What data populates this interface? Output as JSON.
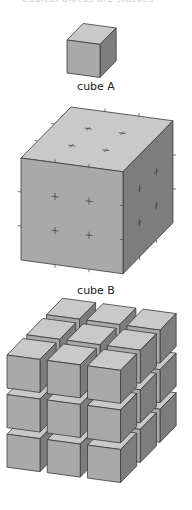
{
  "header": {
    "cropped_text": "Cubical blocks are stacked"
  },
  "figures": [
    {
      "id": "cube-a",
      "label": "cube A"
    },
    {
      "id": "cube-b",
      "label": "cube B",
      "tick_divisions": 3
    },
    {
      "id": "stack",
      "label": "",
      "grid": [
        3,
        3,
        3
      ]
    }
  ],
  "colors": {
    "top_face": "#c9c9c9",
    "front_face": "#a9a9a9",
    "side_face": "#7d7d7d",
    "edge": "#3a3a3a",
    "label_text": "#222222"
  }
}
